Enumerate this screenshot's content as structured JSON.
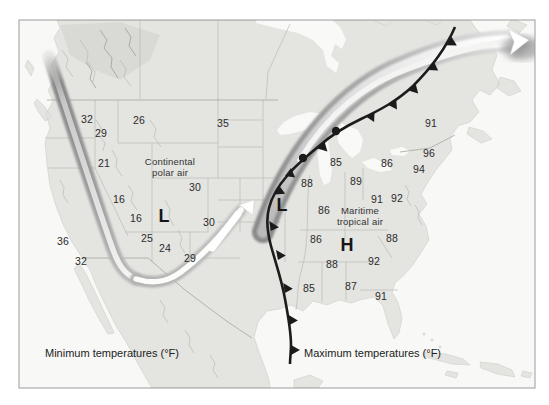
{
  "captions": {
    "minimum": "Minimum temperatures (°F)",
    "maximum": "Maximum temperatures (°F)"
  },
  "air_masses": {
    "continental_polar": {
      "line1": "Continental",
      "line2": "polar air"
    },
    "maritime_tropical": {
      "line1": "Maritime",
      "line2": "tropical air"
    }
  },
  "pressure_centers": {
    "west_low": "L",
    "central_low": "L",
    "southeast_high": "H"
  },
  "min_temperatures": [
    "32",
    "29",
    "26",
    "35",
    "21",
    "30",
    "16",
    "16",
    "30",
    "25",
    "24",
    "29",
    "36",
    "32"
  ],
  "max_temperatures": [
    "85",
    "86",
    "88",
    "89",
    "91",
    "92",
    "91",
    "96",
    "94",
    "86",
    "86",
    "88",
    "88",
    "92",
    "85",
    "87",
    "91"
  ],
  "symbols": {
    "cold_front": "cold-front-line",
    "jet_stream": "jet-stream-ribbon-arrow"
  },
  "colors": {
    "land": "#e4e4e1",
    "ocean": "#f8f8f6",
    "front": "#1c1c1c",
    "jet_stream_dark": "#8a8a8a",
    "jet_stream_light": "#ffffff",
    "text": "#2b2b2b"
  }
}
